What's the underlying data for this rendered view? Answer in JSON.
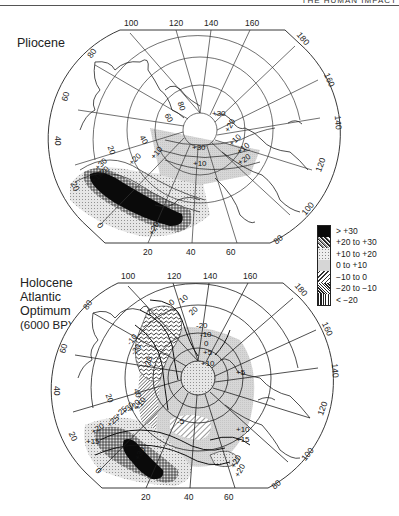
{
  "header": {
    "running_title": "THE HUMAN IMPACT"
  },
  "maps": [
    {
      "id": "pliocene",
      "title": "Pliocene",
      "title_lines": [
        "Pliocene"
      ],
      "longitude_labels_top": [
        "100",
        "120",
        "140",
        "160"
      ],
      "longitude_labels_right": [
        "180",
        "160",
        "140",
        "120",
        "100",
        "80"
      ],
      "longitude_labels_left": [
        "80",
        "60",
        "40",
        "20",
        "0"
      ],
      "longitude_labels_bottom": [
        "20",
        "40",
        "60"
      ],
      "inner_latitude_labels": [
        "80",
        "60",
        "40",
        "20"
      ],
      "contour_labels": [
        "+30",
        "+30",
        "+20",
        "+10",
        "+10",
        "+20",
        "+10",
        "+30",
        "+20",
        "+10",
        "+20",
        "+10",
        "+20"
      ]
    },
    {
      "id": "holocene",
      "title": "Holocene Atlantic Optimum (6000 BP)",
      "title_lines": [
        "Holocene",
        "Atlantic",
        "Optimum",
        "(6000 BP)"
      ],
      "longitude_labels_top": [
        "100",
        "120",
        "140",
        "160"
      ],
      "longitude_labels_right": [
        "180",
        "160",
        "140",
        "120",
        "100",
        "80"
      ],
      "longitude_labels_left": [
        "80",
        "60",
        "40",
        "20",
        "0"
      ],
      "longitude_labels_bottom": [
        "20",
        "40",
        "60"
      ],
      "inner_latitude_labels": [
        "40",
        "20"
      ],
      "contour_labels": [
        "0",
        "10",
        "20",
        "-20",
        "-10",
        "-10",
        "-20",
        "-20",
        "0",
        "+5",
        "+10",
        "+5",
        "-5",
        "+10",
        "+15",
        "+20",
        "+20",
        "+25",
        "+30",
        "+20",
        "+10",
        "+20",
        "+25",
        "+15",
        "+30"
      ]
    }
  ],
  "legend": {
    "title": "Temperature anomaly",
    "items": [
      {
        "label": "> +30",
        "pattern": "solid-black"
      },
      {
        "label": "+20 to +30",
        "pattern": "dense-stipple"
      },
      {
        "label": "+10 to +20",
        "pattern": "light-stipple"
      },
      {
        "label": "0 to +10",
        "pattern": "light-grey"
      },
      {
        "label": "−10 to 0",
        "pattern": "diagonal-hatch"
      },
      {
        "label": "−20 to −10",
        "pattern": "dense-diagonal-hatch"
      },
      {
        "label": "< −20",
        "pattern": "vertical-hatch"
      }
    ]
  },
  "colors": {
    "ink": "#1a1a1a",
    "grid": "#333333",
    "grey_fill": "#d4d4d4",
    "stipple": "#888888"
  }
}
